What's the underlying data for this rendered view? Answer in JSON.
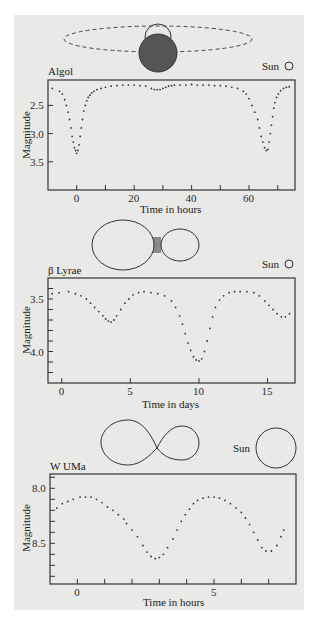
{
  "figure": {
    "background": "#e9e9e8",
    "ink": "#333333",
    "star_fill_dark": "#555555",
    "bridge_fill": "#8a8a8a"
  },
  "chart_data": [
    {
      "type": "scatter",
      "title": "Algol",
      "xlabel": "Time in hours",
      "ylabel": "Magnitude",
      "y_inverted": true,
      "xlim": [
        -10,
        76
      ],
      "ylim": [
        2.05,
        4.0
      ],
      "xticks": [
        0,
        10,
        20,
        30,
        40,
        50,
        60,
        70
      ],
      "xtick_labels": [
        "0",
        "",
        "20",
        "",
        "40",
        "",
        "60",
        ""
      ],
      "yticks": [
        2.5,
        3.0,
        3.5
      ],
      "ytick_labels": [
        "2.5",
        "3.0",
        "3.5"
      ],
      "grid": false,
      "annotation": "Sun",
      "x": [
        -8.5,
        -6,
        -5,
        -4.2,
        -3.6,
        -3,
        -2.5,
        -2,
        -1.6,
        -1.2,
        -0.8,
        -0.4,
        0,
        0.4,
        0.8,
        1.2,
        1.6,
        2,
        2.5,
        3,
        3.5,
        4,
        4.6,
        5.2,
        6,
        7,
        8.5,
        10,
        12,
        14,
        16,
        18,
        20,
        22,
        24,
        26,
        27,
        28,
        29,
        30,
        31,
        32,
        33,
        34,
        36,
        38,
        40,
        42,
        44,
        46,
        48,
        50,
        52,
        54,
        56,
        58,
        59,
        60,
        61,
        62,
        63,
        63.6,
        64.2,
        64.8,
        65.4,
        66,
        66.6,
        67,
        67.4,
        67.8,
        68.2,
        68.6,
        69,
        69.6,
        70.2,
        71,
        72,
        73,
        74
      ],
      "y": [
        2.2,
        2.25,
        2.3,
        2.4,
        2.5,
        2.62,
        2.75,
        2.9,
        3.05,
        3.15,
        3.25,
        3.3,
        3.35,
        3.3,
        3.2,
        3.05,
        2.9,
        2.75,
        2.6,
        2.5,
        2.42,
        2.36,
        2.32,
        2.28,
        2.25,
        2.22,
        2.2,
        2.18,
        2.16,
        2.15,
        2.14,
        2.14,
        2.14,
        2.15,
        2.16,
        2.2,
        2.22,
        2.22,
        2.22,
        2.2,
        2.18,
        2.16,
        2.15,
        2.14,
        2.14,
        2.14,
        2.13,
        2.14,
        2.14,
        2.14,
        2.15,
        2.15,
        2.16,
        2.18,
        2.2,
        2.25,
        2.3,
        2.38,
        2.5,
        2.62,
        2.75,
        2.9,
        3.05,
        3.15,
        3.25,
        3.3,
        3.28,
        3.15,
        3.0,
        2.85,
        2.7,
        2.55,
        2.45,
        2.36,
        2.3,
        2.24,
        2.2,
        2.18,
        2.17
      ]
    },
    {
      "type": "scatter",
      "title": "β Lyrae",
      "xlabel": "Time in days",
      "ylabel": "Magnitude",
      "y_inverted": true,
      "xlim": [
        -1.0,
        17.0
      ],
      "ylim": [
        3.3,
        4.3
      ],
      "xticks": [
        0,
        5,
        10,
        15
      ],
      "xtick_labels": [
        "0",
        "5",
        "10",
        "15"
      ],
      "yticks": [
        3.4,
        3.5,
        3.6,
        3.7,
        3.8,
        3.9,
        4.0,
        4.1,
        4.2
      ],
      "ytick_labels": [
        "",
        "3.5",
        "",
        "",
        "",
        "",
        "4.0",
        "",
        ""
      ],
      "grid": false,
      "annotation": "Sun",
      "x": [
        -0.7,
        -0.2,
        0.5,
        1.0,
        1.4,
        1.8,
        2.1,
        2.4,
        2.7,
        3.0,
        3.2,
        3.4,
        3.6,
        3.8,
        4.0,
        4.3,
        4.6,
        4.9,
        5.2,
        5.6,
        6.0,
        6.5,
        7.0,
        7.5,
        8.0,
        8.3,
        8.6,
        8.8,
        9.0,
        9.2,
        9.4,
        9.6,
        9.8,
        10.0,
        10.2,
        10.4,
        10.6,
        10.8,
        11.0,
        11.2,
        11.5,
        11.8,
        12.2,
        12.6,
        13.0,
        13.5,
        14.0,
        14.4,
        14.8,
        15.1,
        15.4,
        15.7,
        16.0,
        16.3,
        16.6
      ],
      "y": [
        3.45,
        3.44,
        3.43,
        3.45,
        3.47,
        3.5,
        3.54,
        3.58,
        3.62,
        3.66,
        3.69,
        3.71,
        3.72,
        3.7,
        3.66,
        3.6,
        3.54,
        3.5,
        3.46,
        3.44,
        3.43,
        3.44,
        3.45,
        3.47,
        3.52,
        3.58,
        3.66,
        3.74,
        3.83,
        3.92,
        3.99,
        4.05,
        4.08,
        4.09,
        4.07,
        4.0,
        3.9,
        3.78,
        3.67,
        3.58,
        3.51,
        3.47,
        3.44,
        3.43,
        3.43,
        3.43,
        3.44,
        3.47,
        3.52,
        3.56,
        3.6,
        3.64,
        3.67,
        3.67,
        3.64
      ]
    },
    {
      "type": "scatter",
      "title": "W UMa",
      "xlabel": "Time in hours",
      "ylabel": "Magnitude",
      "y_inverted": true,
      "xlim": [
        -1.0,
        8.0
      ],
      "ylim": [
        7.87,
        8.87
      ],
      "xticks": [
        0,
        1,
        2,
        3,
        4,
        5,
        6,
        7
      ],
      "xtick_labels": [
        "0",
        "",
        "",
        "",
        "",
        "5",
        "",
        ""
      ],
      "yticks": [
        7.9,
        8.0,
        8.1,
        8.2,
        8.3,
        8.4,
        8.5,
        8.6,
        8.7,
        8.8
      ],
      "ytick_labels": [
        "",
        "8.0",
        "",
        "",
        "",
        "",
        "8.5",
        "",
        "",
        ""
      ],
      "grid": false,
      "annotation": "Sun",
      "x": [
        -0.75,
        -0.55,
        -0.35,
        -0.15,
        0.1,
        0.3,
        0.5,
        0.7,
        0.9,
        1.1,
        1.3,
        1.5,
        1.7,
        1.8,
        2.0,
        2.2,
        2.4,
        2.55,
        2.7,
        2.85,
        3.0,
        3.15,
        3.3,
        3.5,
        3.65,
        3.8,
        3.95,
        4.1,
        4.25,
        4.4,
        4.6,
        4.8,
        5.0,
        5.2,
        5.4,
        5.6,
        5.8,
        6.0,
        6.15,
        6.3,
        6.45,
        6.6,
        6.75,
        6.9,
        7.1,
        7.3,
        7.45,
        7.55
      ],
      "y": [
        8.18,
        8.14,
        8.12,
        8.1,
        8.08,
        8.08,
        8.08,
        8.1,
        8.13,
        8.17,
        8.2,
        8.24,
        8.28,
        8.32,
        8.38,
        8.44,
        8.52,
        8.58,
        8.62,
        8.64,
        8.63,
        8.6,
        8.54,
        8.46,
        8.38,
        8.3,
        8.24,
        8.19,
        8.14,
        8.11,
        8.09,
        8.08,
        8.08,
        8.09,
        8.11,
        8.14,
        8.18,
        8.22,
        8.27,
        8.33,
        8.4,
        8.47,
        8.54,
        8.57,
        8.57,
        8.52,
        8.44,
        8.38
      ]
    }
  ],
  "diagrams": {
    "algol": {
      "label": "eclipsing binary: dark primary in front of smaller companion on dashed orbit"
    },
    "beta_lyrae": {
      "label": "ellipsoidal pair with gas bridge"
    },
    "w_uma": {
      "label": "contact binary (peanut shape)"
    }
  },
  "labels": {
    "algol_title": "Algol",
    "beta_title": "β Lyrae",
    "wuma_title": "W UMa",
    "sun": "Sun",
    "ylabel": "Magnitude",
    "xlabel_hours": "Time in hours",
    "xlabel_days": "Time in days"
  }
}
